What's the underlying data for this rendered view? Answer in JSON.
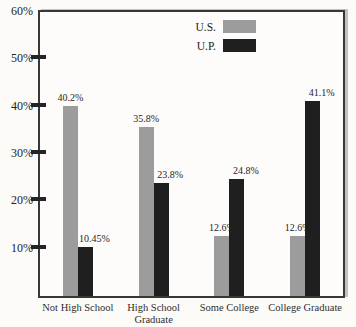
{
  "figure": {
    "background": "#fcfbf8",
    "border_color": "#383838"
  },
  "legend": {
    "items": [
      {
        "label": "U.S.",
        "color": "#9c9c9c"
      },
      {
        "label": "U.P.",
        "color": "#1f1f1f"
      }
    ]
  },
  "chart_data": {
    "type": "bar",
    "categories": [
      "Not High School",
      "High School Graduate",
      "Some College",
      "College Graduate"
    ],
    "series": [
      {
        "name": "U.S.",
        "color": "#9c9c9c",
        "values": [
          40.2,
          35.8,
          12.6,
          12.6
        ],
        "labels": [
          "40.2%",
          "35.8%",
          "12.6%",
          "12.6%"
        ]
      },
      {
        "name": "U.P.",
        "color": "#1f1f1f",
        "values": [
          10.45,
          23.8,
          24.8,
          41.1
        ],
        "labels": [
          "10.45%",
          "23.8%",
          "24.8%",
          "41.1%"
        ]
      }
    ],
    "xlabel": "",
    "ylabel": "",
    "ylim": [
      0,
      60
    ],
    "yticks": [
      10,
      20,
      30,
      40,
      50,
      60
    ],
    "ytick_labels": [
      "10%",
      "20%",
      "30%",
      "40%",
      "50%",
      "60%"
    ],
    "grid": false,
    "legend_position": "top-center"
  }
}
